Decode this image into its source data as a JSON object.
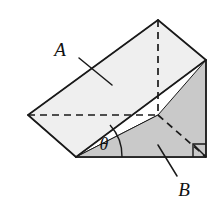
{
  "figure": {
    "name": "inclined-plane-wedge-diagram",
    "background_color": "#ffffff",
    "labels": {
      "incline_face": "A",
      "side_face": "B",
      "base_angle": "θ"
    },
    "colors": {
      "outline": "#1a1a1a",
      "incline_face_fill": "#efefef",
      "side_face_fill": "#c9c9c9",
      "end_face_fill": "#fbfbfb",
      "base_face_fill": "#d2d2d2"
    },
    "geometry": {
      "apex_top": [
        158,
        20
      ],
      "left_vertex": [
        28,
        115
      ],
      "bottom_left": [
        76,
        157
      ],
      "bottom_right": [
        206,
        157
      ],
      "right_top": [
        206,
        60
      ],
      "hidden_center": [
        158,
        115
      ],
      "incline_low_left": [
        76,
        157
      ],
      "incline_high_right": [
        206,
        60
      ]
    },
    "annotations": {
      "angle_arc_radius": 46,
      "right_angle_size": 13,
      "label_a_position": [
        60,
        50
      ],
      "label_b_position": [
        178,
        192
      ],
      "label_theta_position": [
        104,
        148
      ]
    }
  }
}
